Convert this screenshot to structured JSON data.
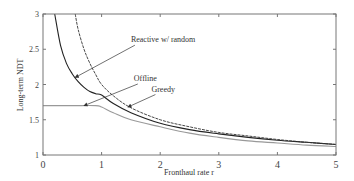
{
  "chart_data": {
    "type": "line",
    "title": "",
    "xlabel": "Fronthaul rate r",
    "ylabel": "Long-term NDT",
    "xlim": [
      0,
      5
    ],
    "ylim": [
      1,
      3
    ],
    "xticks": [
      "0",
      "1",
      "2",
      "3",
      "4",
      "5"
    ],
    "yticks": [
      "1",
      "1.5",
      "2",
      "2.5",
      "3"
    ],
    "grid": false,
    "legend": "annotations with arrows",
    "series": [
      {
        "name": "Reactive w/ random",
        "color": "#222222",
        "style": "solid",
        "x": [
          0.2,
          0.3,
          0.4,
          0.5,
          0.6,
          0.7,
          0.8,
          0.9,
          1.0,
          1.2,
          1.5,
          2.0,
          2.5,
          3.0,
          3.5,
          4.0,
          4.5,
          5.0
        ],
        "y": [
          3.0,
          2.55,
          2.3,
          2.15,
          2.04,
          1.96,
          1.9,
          1.87,
          1.85,
          1.73,
          1.6,
          1.45,
          1.36,
          1.3,
          1.25,
          1.21,
          1.18,
          1.15
        ]
      },
      {
        "name": "Greedy",
        "color": "#333333",
        "style": "dashed",
        "x": [
          0.55,
          0.6,
          0.7,
          0.8,
          0.9,
          1.0,
          1.2,
          1.5,
          2.0,
          2.5,
          3.0,
          3.5,
          4.0,
          4.5,
          5.0
        ],
        "y": [
          3.0,
          2.78,
          2.5,
          2.3,
          2.14,
          2.0,
          1.84,
          1.67,
          1.5,
          1.4,
          1.32,
          1.27,
          1.22,
          1.18,
          1.15
        ]
      },
      {
        "name": "Offline",
        "color": "#999999",
        "style": "solid",
        "x": [
          0.0,
          0.5,
          0.9,
          1.0,
          1.2,
          1.5,
          2.0,
          2.5,
          3.0,
          3.5,
          4.0,
          4.5,
          5.0
        ],
        "y": [
          1.7,
          1.7,
          1.7,
          1.68,
          1.6,
          1.5,
          1.4,
          1.31,
          1.25,
          1.2,
          1.17,
          1.14,
          1.12
        ]
      }
    ],
    "annotations": [
      {
        "text": "Reactive w/ random",
        "text_xy": [
          1.5,
          2.6
        ],
        "arrow_to": [
          0.55,
          2.1
        ]
      },
      {
        "text": "Offline",
        "text_xy": [
          1.55,
          2.05
        ],
        "arrow_to": [
          0.7,
          1.7
        ]
      },
      {
        "text": "Greedy",
        "text_xy": [
          1.85,
          1.9
        ],
        "arrow_to": [
          1.45,
          1.68
        ]
      }
    ]
  }
}
